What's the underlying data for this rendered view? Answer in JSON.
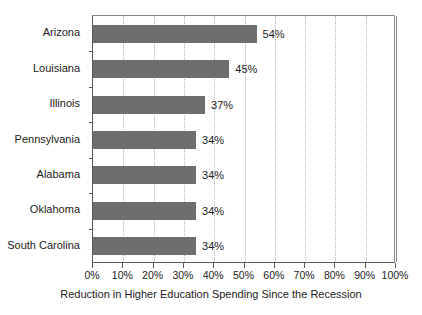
{
  "chart_data": {
    "type": "bar",
    "orientation": "horizontal",
    "title": "",
    "xlabel": "Reduction in Higher Education Spending Since the Recession",
    "ylabel": "",
    "categories": [
      "Arizona",
      "Louisiana",
      "Illinois",
      "Pennsylvania",
      "Alabama",
      "Oklahoma",
      "South Carolina"
    ],
    "values": [
      54,
      45,
      37,
      34,
      34,
      34,
      34
    ],
    "value_labels": [
      "54%",
      "45%",
      "37%",
      "34%",
      "34%",
      "34%",
      "34%"
    ],
    "xlim": [
      0,
      100
    ],
    "xticks": [
      0,
      10,
      20,
      30,
      40,
      50,
      60,
      70,
      80,
      90,
      100
    ],
    "xticklabels": [
      "0%",
      "10%",
      "20%",
      "30%",
      "40%",
      "50%",
      "60%",
      "70%",
      "80%",
      "90%",
      "100%"
    ],
    "grid": "vertical-dotted",
    "legend": "none",
    "bar_color": "#6e6e6e",
    "grid_color": "#b4b4b4",
    "axis_color": "#5a5a5a",
    "background": "#ffffff"
  }
}
